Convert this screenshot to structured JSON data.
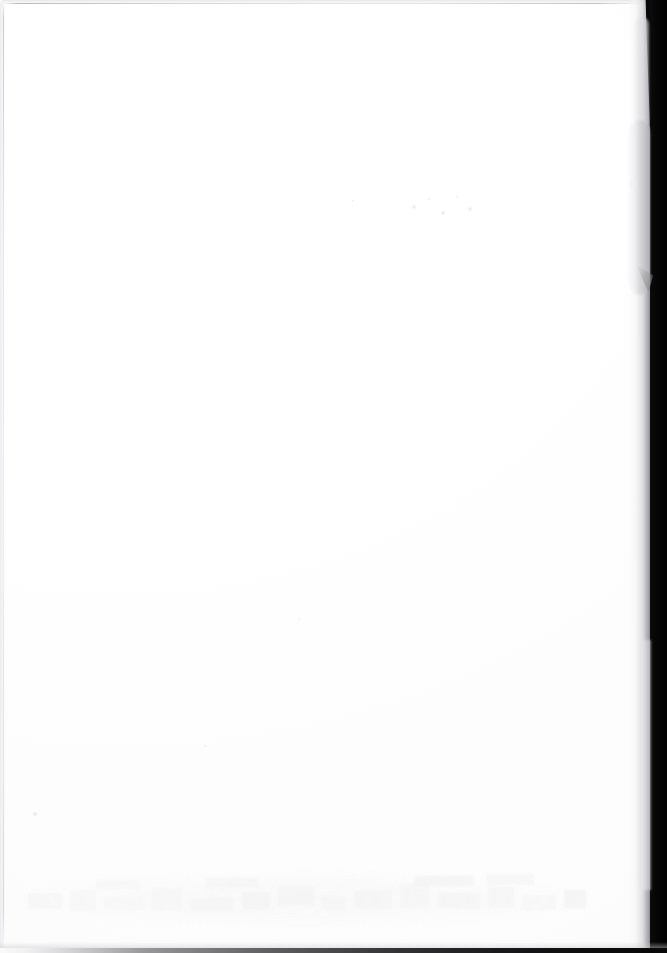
{
  "document": {
    "kind": "scanned-page",
    "content_description": "Blank scanned page",
    "visible_text": "",
    "page_width": 667,
    "page_height": 953,
    "caption": "Blank white scanned page with dark scanner background along the right edge"
  },
  "colors": {
    "paper_white": "#ffffff",
    "paper_offwhite": "#fdfdfd",
    "scanner_background_black": "#070708",
    "scanner_band_core": "#000000",
    "edge_line_gray": "#b4b4b8",
    "curl_shadow_gray": "#c8c8cc",
    "ghost_showthrough_gray": "#e8e8ea"
  },
  "regions": {
    "paper_sheet": {
      "label": "Paper sheet",
      "x": 0,
      "y": 0,
      "width": 651,
      "height": 949
    },
    "right_scanner_band": {
      "label": "Scanner background band",
      "x": 648,
      "y": 0,
      "width": 19,
      "height": 953
    },
    "bottom_scanner_strip": {
      "label": "Scanner background strip",
      "x": 0,
      "y": 948,
      "width": 667,
      "height": 5
    },
    "page_curl": {
      "label": "Page curl shadow",
      "x": 626,
      "y": 120,
      "width": 24,
      "height": 175
    },
    "top_edge_line": {
      "label": "Top paper edge",
      "x": 4,
      "y": 3,
      "width": 642,
      "height": 1
    },
    "left_edge_line": {
      "label": "Left paper edge",
      "x": 3,
      "y": 3,
      "width": 1,
      "height": 944
    },
    "showthrough_area": {
      "label": "Faint show-through ghosting",
      "x": 20,
      "y": 875,
      "width": 1150,
      "height": 55
    }
  },
  "ghosting": {
    "description": "Extremely faint ink show-through from the reverse side; no legible characters",
    "marks": [
      {
        "x": 28,
        "y": 893,
        "w": 34,
        "h": 16
      },
      {
        "x": 70,
        "y": 890,
        "w": 26,
        "h": 21
      },
      {
        "x": 104,
        "y": 896,
        "w": 40,
        "h": 14
      },
      {
        "x": 152,
        "y": 888,
        "w": 30,
        "h": 22
      },
      {
        "x": 190,
        "y": 898,
        "w": 44,
        "h": 13
      },
      {
        "x": 242,
        "y": 892,
        "w": 28,
        "h": 18
      },
      {
        "x": 278,
        "y": 886,
        "w": 36,
        "h": 20
      },
      {
        "x": 322,
        "y": 897,
        "w": 24,
        "h": 14
      },
      {
        "x": 354,
        "y": 890,
        "w": 38,
        "h": 19
      },
      {
        "x": 400,
        "y": 884,
        "w": 30,
        "h": 24
      },
      {
        "x": 438,
        "y": 893,
        "w": 42,
        "h": 16
      },
      {
        "x": 488,
        "y": 887,
        "w": 26,
        "h": 21
      },
      {
        "x": 522,
        "y": 895,
        "w": 34,
        "h": 15
      },
      {
        "x": 564,
        "y": 890,
        "w": 22,
        "h": 18
      },
      {
        "x": 414,
        "y": 876,
        "w": 60,
        "h": 10
      },
      {
        "x": 486,
        "y": 874,
        "w": 48,
        "h": 11
      },
      {
        "x": 206,
        "y": 878,
        "w": 52,
        "h": 10
      },
      {
        "x": 96,
        "y": 880,
        "w": 44,
        "h": 9
      }
    ],
    "specks": [
      {
        "x": 33,
        "y": 812,
        "r": 2
      },
      {
        "x": 412,
        "y": 205,
        "r": 2
      },
      {
        "x": 428,
        "y": 198,
        "r": 1
      },
      {
        "x": 441,
        "y": 211,
        "r": 2
      },
      {
        "x": 456,
        "y": 196,
        "r": 1
      },
      {
        "x": 468,
        "y": 207,
        "r": 2
      },
      {
        "x": 352,
        "y": 200,
        "r": 1
      },
      {
        "x": 631,
        "y": 182,
        "r": 2
      },
      {
        "x": 636,
        "y": 190,
        "r": 1
      },
      {
        "x": 298,
        "y": 618,
        "r": 1
      },
      {
        "x": 204,
        "y": 745,
        "r": 1
      }
    ]
  }
}
